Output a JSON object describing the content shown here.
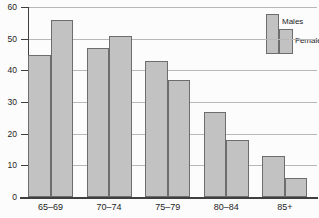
{
  "chart_data": {
    "type": "bar",
    "title": "",
    "xlabel": "",
    "ylabel": "",
    "categories": [
      "65–69",
      "70–74",
      "75–79",
      "80–84",
      "85+"
    ],
    "series": [
      {
        "name": "Males",
        "values": [
          45,
          47,
          43,
          27,
          13
        ]
      },
      {
        "name": "Females",
        "values": [
          56,
          51,
          37,
          18,
          6
        ]
      }
    ],
    "ylim": [
      0,
      60
    ],
    "yticks": [
      0,
      10,
      20,
      30,
      40,
      50,
      60
    ],
    "grid": true,
    "legend_position": "top-right",
    "colors": {
      "bar_fill": "#c2c2c2",
      "bar_border": "#6d6d6d",
      "gridline": "#b8b8b8",
      "axis": "#3f3f3f",
      "text": "#1c1c1c",
      "background": "#fcfcfc"
    }
  }
}
